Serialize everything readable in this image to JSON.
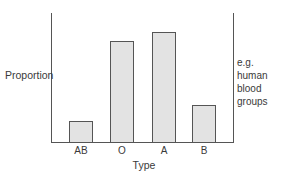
{
  "chart_data": {
    "type": "bar",
    "title": "",
    "xlabel": "Type",
    "ylabel": "Proportion",
    "categories": [
      "AB",
      "O",
      "A",
      "B"
    ],
    "values": [
      0.16,
      0.78,
      0.85,
      0.29
    ],
    "ylim": [
      0,
      1
    ],
    "grid": false,
    "legend": null,
    "annotations": [
      "e.g. human blood groups"
    ],
    "bar_color": "#e3e3e3",
    "edge_color": "#555555"
  },
  "labels": {
    "ylabel": "Proportion",
    "xlabel": "Type",
    "note_line1": "e.g. human",
    "note_line2": "blood",
    "note_line3": "groups",
    "ticks": [
      "AB",
      "O",
      "A",
      "B"
    ]
  }
}
